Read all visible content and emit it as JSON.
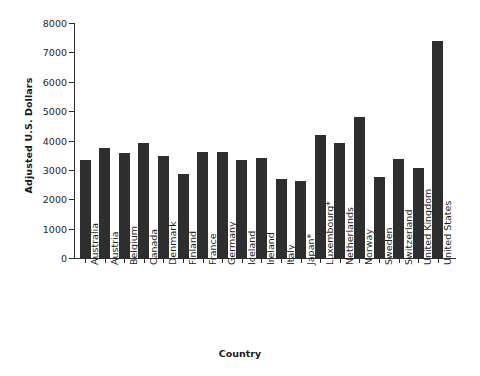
{
  "chart_data": {
    "type": "bar",
    "title": "",
    "xlabel": "Country",
    "ylabel": "Adjusted U.S. Dollars",
    "ylim": [
      0,
      8000
    ],
    "ytick_labels": [
      "0",
      "1000",
      "2000",
      "3000",
      "4000",
      "5000",
      "6000",
      "7000",
      "8000"
    ],
    "yticks": [
      0,
      1000,
      2000,
      3000,
      4000,
      5000,
      6000,
      7000,
      8000
    ],
    "grid": false,
    "legend": null,
    "bar_color": "#2e2e2e",
    "axis_color": "#2b2b2b",
    "categories": [
      "Australia",
      "Austria",
      "Belgium",
      "Canada",
      "Denmark",
      "Finland",
      "France",
      "Germany",
      "Iceland",
      "Ireland",
      "Italy",
      "Japan*",
      "Luxembourg*",
      "Netherlands",
      "Norway",
      "Sweden",
      "Switzerland",
      "United Kingdom",
      "United States"
    ],
    "values": [
      3350,
      3750,
      3560,
      3900,
      3460,
      2850,
      3620,
      3610,
      3330,
      3420,
      2700,
      2620,
      4200,
      3900,
      4800,
      2750,
      3380,
      3070,
      7380
    ]
  }
}
